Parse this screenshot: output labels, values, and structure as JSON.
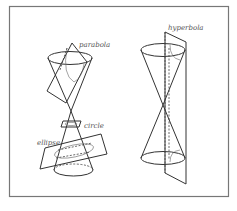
{
  "figure": {
    "labels": {
      "parabola": "parabola",
      "circle": "circle",
      "ellipse": "ellipse",
      "hyperbola": "hyperbola"
    },
    "colors": {
      "background": "#ffffff",
      "frame": "#777777",
      "line": "#333333",
      "label": "#555555"
    }
  }
}
